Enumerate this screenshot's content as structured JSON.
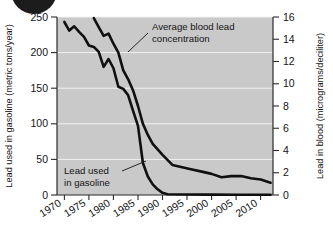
{
  "figure": {
    "background": "#ffffff",
    "plot_background": "#c9c9c9",
    "line_color": "#101010",
    "gridline_color": "#f2f2f2",
    "decoration": {
      "name": "page-corner-dot",
      "color": "#1c1c1c"
    }
  },
  "annotations": {
    "blood": {
      "line1": "Average blood lead",
      "line2": "concentration"
    },
    "gasoline": {
      "line1": "Lead used",
      "line2": "in gasoline"
    }
  },
  "chart_data": {
    "type": "line",
    "title": "",
    "xlabel": "",
    "ylabel": "Lead used in gasoline (metric tons/year)",
    "y2label": "Lead in blood (micrograms/deciliter)",
    "grid": true,
    "legend": "annotations",
    "xlim": [
      1968.5,
      2012.5
    ],
    "ylim": [
      0,
      250
    ],
    "y2lim": [
      0,
      16
    ],
    "xticks": [
      1970,
      1975,
      1980,
      1985,
      1990,
      1995,
      2000,
      2005,
      2010
    ],
    "xticklabels": [
      "1970",
      "1975",
      "1980",
      "1985",
      "1990",
      "1995",
      "2000",
      "2005",
      "2010"
    ],
    "yticks": [
      0,
      50,
      100,
      150,
      200,
      250
    ],
    "yticklabels": [
      "0",
      "50",
      "100",
      "150",
      "200",
      "250"
    ],
    "y2ticks": [
      0,
      2,
      4,
      6,
      8,
      10,
      12,
      14,
      16
    ],
    "y2ticklabels": [
      "0",
      "2",
      "4",
      "6",
      "8",
      "10",
      "12",
      "14",
      "16"
    ],
    "series": [
      {
        "name": "Lead used in gasoline",
        "axis": "left",
        "units": "metric tons/year",
        "x": [
          1970,
          1971,
          1972,
          1973,
          1974,
          1975,
          1976,
          1977,
          1978,
          1979,
          1980,
          1981,
          1982,
          1983,
          1984,
          1985,
          1986,
          1987,
          1988,
          1989,
          1990,
          1991,
          1995,
          2000,
          2005,
          2010,
          2012
        ],
        "values": [
          243,
          231,
          237,
          229,
          222,
          210,
          208,
          201,
          180,
          191,
          178,
          152,
          149,
          140,
          118,
          97,
          45,
          26,
          15,
          8,
          3,
          1,
          0.6,
          0.5,
          0.4,
          0.4,
          0.4
        ]
      },
      {
        "name": "Average blood lead concentration",
        "axis": "right",
        "units": "micrograms/deciliter",
        "x": [
          1976,
          1977,
          1978,
          1979,
          1980,
          1981,
          1982,
          1983,
          1984,
          1985,
          1986,
          1987,
          1988,
          1990,
          1992,
          1994,
          1996,
          1998,
          2000,
          2002,
          2004,
          2006,
          2008,
          2010,
          2012
        ],
        "values": [
          15.9,
          15.1,
          14.3,
          14.5,
          13.6,
          12.8,
          11.2,
          10.4,
          9.4,
          8.0,
          6.4,
          5.4,
          4.6,
          3.6,
          2.7,
          2.5,
          2.3,
          2.1,
          1.9,
          1.6,
          1.7,
          1.7,
          1.5,
          1.4,
          1.1
        ]
      }
    ]
  }
}
